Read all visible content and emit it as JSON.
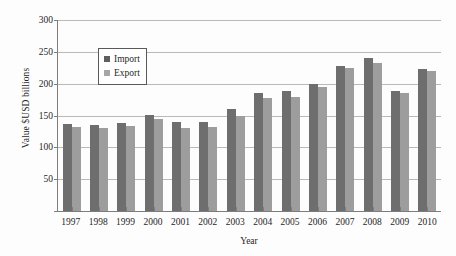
{
  "chart_data": {
    "type": "bar",
    "title": "",
    "xlabel": "Year",
    "ylabel": "Value $USD billions",
    "ylim": [
      0,
      300
    ],
    "yticks": [
      0,
      50,
      100,
      150,
      200,
      250,
      300
    ],
    "ytick_labels": [
      "",
      "50",
      "100",
      "150",
      "200",
      "250",
      "300"
    ],
    "grid": true,
    "legend_position": "upper-left-inside",
    "categories": [
      "1997",
      "1998",
      "1999",
      "2000",
      "2001",
      "2002",
      "2003",
      "2004",
      "2005",
      "2006",
      "2007",
      "2008",
      "2009",
      "2010"
    ],
    "series": [
      {
        "name": "Import",
        "color": "#6e6e6e",
        "values": [
          137,
          135,
          139,
          151,
          140,
          140,
          160,
          186,
          188,
          199,
          228,
          240,
          189,
          223
        ]
      },
      {
        "name": "Export",
        "color": "#9d9d9d",
        "values": [
          132,
          130,
          133,
          144,
          131,
          132,
          150,
          177,
          179,
          195,
          224,
          232,
          186,
          220
        ]
      }
    ]
  },
  "legend": {
    "items": [
      {
        "label": "Import",
        "swatch": "import-swatch"
      },
      {
        "label": "Export",
        "swatch": "export-swatch"
      }
    ]
  }
}
